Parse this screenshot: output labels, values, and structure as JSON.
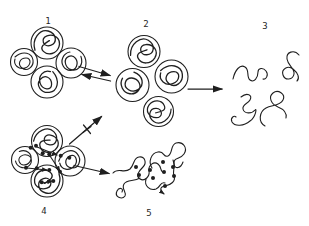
{
  "figure": {
    "background": "#ffffff",
    "ink": "#1f1f1f"
  },
  "labels": {
    "stage1": "1",
    "stage2": "2",
    "stage3": "3",
    "stage4": "4",
    "stage5": "5"
  },
  "icons": {
    "stage1": "compact-oligomer-of-coiled-globules",
    "stage2": "dissociated-coiled-globules",
    "stage3": "unfolded-free-chains",
    "stage4": "crosslinked-oligomer-with-bonds",
    "stage5": "aggregated-crosslinked-network",
    "arrow_1_2": "equilibrium-double-arrow",
    "arrow_2_3": "right-arrow",
    "arrow_4_blocked": "crossed-out-arrow",
    "arrow_4_5": "right-arrow"
  }
}
